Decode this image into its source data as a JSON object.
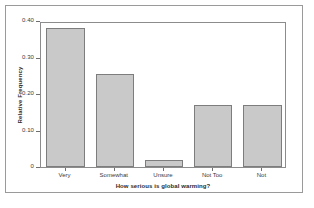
{
  "chart_data": {
    "type": "bar",
    "title": "",
    "subtitle": "",
    "categories": [
      "Very",
      "Somewhat",
      "Unsure",
      "Not Too",
      "Not"
    ],
    "values": [
      0.38,
      0.255,
      0.02,
      0.17,
      0.17
    ],
    "xlabel": "How serious is global warming?",
    "ylabel": "Relative Frequency",
    "ylim": [
      0,
      0.4
    ],
    "ytick_labels": [
      "0.40",
      "0.30",
      "0.20",
      "0.10",
      "0"
    ],
    "ytick_values": [
      0.4,
      0.3,
      0.2,
      0.1,
      0
    ],
    "grid": false,
    "legend": false,
    "legend_position": "none",
    "bar_fill_color": "#c9c9c9",
    "bar_edge_color": "#7d7d7d",
    "panel_border_color": "#8c8c8c",
    "frame_border_color": "#9a9a9a",
    "background_color": "#ffffff",
    "text_color": "#3a3a3a"
  },
  "axes": {
    "y_title": "Relative Frequency",
    "x_title": "How serious is global warming?"
  }
}
